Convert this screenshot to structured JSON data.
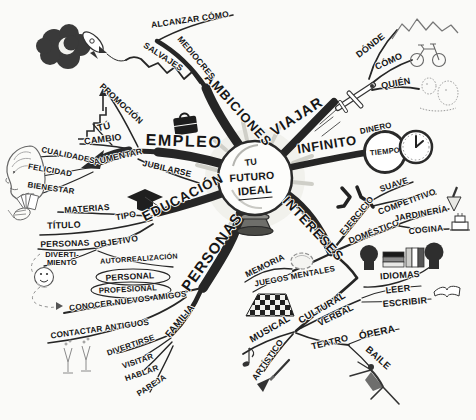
{
  "colors": {
    "ink": "#1e1e1e",
    "paper": "#fafaf8"
  },
  "center": {
    "line1": "TU",
    "line2": "FUTURO",
    "line3": "IDEAL"
  },
  "branches": {
    "ambiciones": {
      "label": "AMBICIONES",
      "children": {
        "salvajes": {
          "label": "SALVAJES"
        },
        "mediocres": {
          "label": "MEDIOCRES"
        },
        "alcanzar_como": {
          "label": "ALCANZAR CÓMO"
        }
      }
    },
    "viajar": {
      "label": "VIAJAR",
      "children": {
        "donde": {
          "label": "DÓNDE"
        },
        "como": {
          "label": "CÓMO"
        },
        "quien": {
          "label": "QUIÉN"
        }
      }
    },
    "infinito": {
      "label": "INFINITO",
      "children": {
        "dinero": {
          "label": "DINERO"
        },
        "tiempo": {
          "label": "TIEMPO"
        }
      }
    },
    "empleo": {
      "label": "EMPLEO",
      "children": {
        "promocion": {
          "label": "PROMOCIÓN"
        },
        "tu": {
          "label": "TÚ"
        },
        "cambio": {
          "label": "CAMBIO"
        },
        "aumentar": {
          "label": "AUMENTAR"
        },
        "jubilarse": {
          "label": "JUBILARSE"
        },
        "cualidades": {
          "label": "CUALIDADES"
        },
        "felicidad": {
          "label": "FELICIDAD"
        },
        "bienestar": {
          "label": "BIENESTAR"
        }
      }
    },
    "educacion": {
      "label": "EDUCACIÓN",
      "children": {
        "materias": {
          "label": "MATERIAS"
        },
        "tipo": {
          "label": "TIPO"
        },
        "titulo": {
          "label": "TÍTULO"
        },
        "personas": {
          "label": "PERSONAS"
        },
        "objetivo": {
          "label": "OBJETIVO"
        },
        "divertimiento": {
          "line1": "DIVERTI-",
          "line2": "MIENTO"
        },
        "autorrealizacion": {
          "label": "AUTORREALIZACIÓN"
        },
        "personal": {
          "label": "PERSONAL"
        },
        "profesional": {
          "label": "PROFESIONAL"
        }
      }
    },
    "personas": {
      "label": "PERSONAS",
      "children": {
        "conocer_nuevos_amigos": {
          "label": "CONOCER NUEVOS AMIGOS"
        },
        "contactar_antiguos": {
          "label": "CONTACTAR ANTIGUOS"
        },
        "familia": {
          "label": "FAMILIA",
          "children": {
            "divertirse": {
              "label": "DIVERTIRSE"
            },
            "visitar": {
              "label": "VISITAR"
            },
            "hablar": {
              "label": "HABLAR"
            },
            "pareja": {
              "label": "PAREJA"
            }
          }
        }
      }
    },
    "intereses": {
      "label": "INTERESES",
      "children": {
        "ejercicio": {
          "label": "EJERCICIO",
          "children": {
            "suave": {
              "label": "SUAVE"
            },
            "competitivo": {
              "label": "COMPETITIVO"
            }
          }
        },
        "domestico": {
          "label": "DOMÉSTICO",
          "children": {
            "jardineria": {
              "label": "JARDINERÍA"
            },
            "cocina": {
              "label": "COCINA"
            }
          }
        },
        "memoria": {
          "label": "MEMORIA"
        },
        "juegos_mentales": {
          "label": "JUEGOS MENTALES"
        },
        "cultural": {
          "label": "CULTURAL",
          "children": {
            "idiomas": {
              "label": "IDIOMAS"
            },
            "verbal": {
              "label": "VERBAL",
              "children": {
                "leer": {
                  "label": "LEER"
                },
                "escribir": {
                  "label": "ESCRIBIR"
                }
              }
            },
            "teatro": {
              "label": "TEATRO",
              "children": {
                "opera": {
                  "label": "ÓPERA"
                },
                "baile": {
                  "label": "BAILE"
                }
              }
            },
            "musical": {
              "label": "MUSICAL"
            },
            "artistico": {
              "label": "ARTÍSTICO"
            }
          }
        }
      }
    }
  },
  "icons": [
    "crescent-moon-cloud-icon",
    "rocket-icon",
    "mountains-icon",
    "bicycle-icon",
    "traveler-icon",
    "airplane-icon",
    "clock-icon",
    "crystal-ball-icon",
    "briefcase-icon",
    "stairs-arrow-icon",
    "head-brain-icon",
    "hand-cards-icon",
    "graduation-cap-icon",
    "smiley-ball-icon",
    "wine-glasses-icon",
    "walking-legs-icon",
    "trowel-icon",
    "cake-icon",
    "talking-heads-icon",
    "german-flag-icon",
    "italian-flag-icon",
    "open-book-icon",
    "brain-icon",
    "chessboard-icon",
    "music-note-icon",
    "paintbrush-icon",
    "dancer-icon",
    "big-arrow-icon"
  ]
}
